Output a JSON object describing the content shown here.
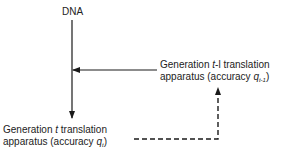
{
  "diagram": {
    "nodes": {
      "dna": {
        "label": "DNA"
      },
      "gen_prev": {
        "line1_pre": "Generation ",
        "line1_var": "t",
        "line1_mid": "-l",
        "line1_post": " translation",
        "line2_pre": "apparatus (accuracy ",
        "line2_var": "q",
        "line2_sub": "t-1",
        "line2_post": ")"
      },
      "gen_curr": {
        "line1_pre": "Generation ",
        "line1_var": "t",
        "line1_post": " translation",
        "line2_pre": "apparatus (accuracy ",
        "line2_var": "q",
        "line2_sub": "t",
        "line2_post": ")"
      }
    },
    "edges": [
      {
        "from": "dna",
        "to": "gen_curr",
        "style": "solid",
        "direction": "down"
      },
      {
        "from": "gen_prev",
        "to": "dna_line",
        "style": "solid",
        "direction": "left"
      },
      {
        "from": "gen_curr",
        "to": "gen_prev",
        "style": "dashed",
        "direction": "right-then-up"
      }
    ],
    "colors": {
      "line": "#1a1a1a",
      "text": "#222222",
      "background": "#ffffff"
    }
  }
}
